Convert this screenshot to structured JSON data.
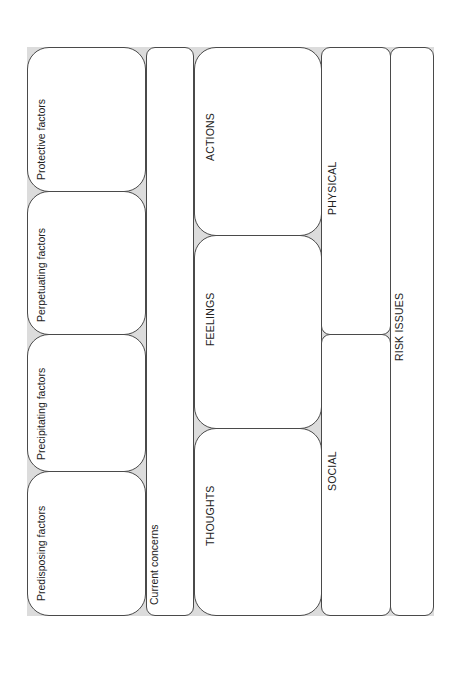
{
  "diagram": {
    "title": "",
    "factors": [
      {
        "id": "protective",
        "label": "Protective factors"
      },
      {
        "id": "perpetuating",
        "label": "Perpetuating factors"
      },
      {
        "id": "precipitating",
        "label": "Precipitating factors"
      },
      {
        "id": "predisposing",
        "label": "Predisposing factors"
      }
    ],
    "current_concerns": {
      "label": "Current concerns"
    },
    "cycle": [
      {
        "id": "actions",
        "label": "ACTIONS"
      },
      {
        "id": "feelings",
        "label": "FEELINGS"
      },
      {
        "id": "thoughts",
        "label": "THOUGHTS"
      }
    ],
    "context": [
      {
        "id": "physical",
        "label": "PHYSICAL"
      },
      {
        "id": "social",
        "label": "SOCIAL"
      }
    ],
    "risk": {
      "label": "RISK ISSUES"
    },
    "colors": {
      "background": "#ffffff",
      "gap_fill": "#dcdcdc",
      "border": "#4a4a4a",
      "text": "#222222"
    }
  }
}
